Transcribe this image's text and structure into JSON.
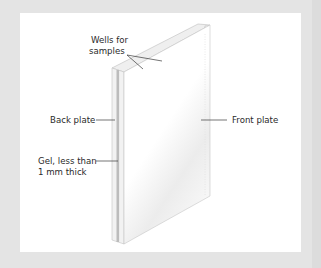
{
  "figure": {
    "type": "labeled diagram",
    "colors": {
      "background": "#e4e4e4",
      "panel": "#ffffff",
      "plate_edge": "#c8c8c8",
      "gel_strip": "#b8b8b8",
      "leader_line": "#3a3a3a",
      "label_text": "#2a2a2a"
    }
  },
  "labels": {
    "wells_line1": "Wells for",
    "wells_line2": "samples",
    "back_plate": "Back plate",
    "front_plate": "Front plate",
    "gel_line1": "Gel, less than",
    "gel_line2": "1 mm thick"
  }
}
